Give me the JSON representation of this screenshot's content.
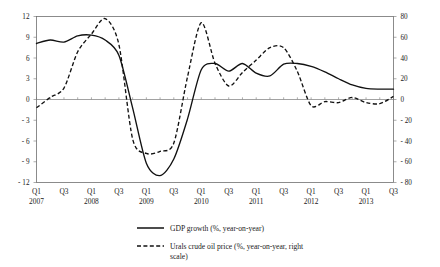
{
  "chart_data": {
    "type": "line",
    "title": "",
    "xlabel": "",
    "ylabel": "",
    "grid": false,
    "legend_position": "bottom",
    "x": [
      "Q1 2007",
      "Q2 2007",
      "Q3 2007",
      "Q4 2007",
      "Q1 2008",
      "Q2 2008",
      "Q3 2008",
      "Q4 2008",
      "Q1 2009",
      "Q2 2009",
      "Q3 2009",
      "Q4 2009",
      "Q1 2010",
      "Q2 2010",
      "Q3 2010",
      "Q4 2010",
      "Q1 2011",
      "Q2 2011",
      "Q3 2011",
      "Q4 2011",
      "Q1 2012",
      "Q2 2012",
      "Q3 2012",
      "Q4 2012",
      "Q1 2013",
      "Q2 2013",
      "Q3 2013"
    ],
    "quarter_ticks": [
      "Q1",
      "Q2",
      "Q3",
      "Q4",
      "Q1",
      "Q2",
      "Q3",
      "Q4",
      "Q1",
      "Q2",
      "Q3",
      "Q4",
      "Q1",
      "Q2",
      "Q3",
      "Q4",
      "Q1",
      "Q2",
      "Q3",
      "Q4",
      "Q1",
      "Q2",
      "Q3",
      "Q4",
      "Q1",
      "Q2",
      "Q3"
    ],
    "quarter_tick_labels": [
      "Q1",
      "",
      "Q3",
      "",
      "Q1",
      "",
      "Q3",
      "",
      "Q1",
      "",
      "Q3",
      "",
      "Q1",
      "",
      "Q3",
      "",
      "Q1",
      "",
      "Q3",
      "",
      "Q1",
      "",
      "Q3",
      "",
      "Q1",
      "",
      "Q3"
    ],
    "year_tick_labels": [
      "2007",
      "",
      "",
      "",
      "2008",
      "",
      "",
      "",
      "2009",
      "",
      "",
      "",
      "2010",
      "",
      "",
      "",
      "2011",
      "",
      "",
      "",
      "2012",
      "",
      "",
      "",
      "2013",
      "",
      ""
    ],
    "series": [
      {
        "name": "GDP growth (%, year-on-year)",
        "axis": "left",
        "style": "solid",
        "values": [
          8.1,
          8.6,
          8.3,
          9.2,
          9.3,
          8.6,
          6.4,
          -1.2,
          -9.2,
          -11.0,
          -8.6,
          -2.8,
          4.3,
          5.2,
          4.1,
          5.2,
          3.8,
          3.4,
          5.1,
          5.2,
          4.8,
          4.0,
          3.0,
          2.1,
          1.6,
          1.5,
          1.5
        ]
      },
      {
        "name": "Urals crude oil price (%, year-on-year, right scale)",
        "axis": "right",
        "style": "dashed",
        "values": [
          -8,
          2,
          11,
          46,
          63,
          78,
          53,
          -38,
          -52,
          -50,
          -42,
          22,
          74,
          35,
          13,
          26,
          38,
          50,
          50,
          27,
          -6,
          -2,
          -3,
          2,
          -3,
          -4,
          3
        ]
      }
    ],
    "left_axis": {
      "min": -12,
      "max": 12,
      "ticks": [
        12,
        9,
        6,
        3,
        0,
        -3,
        -6,
        -9,
        -12
      ],
      "tick_labels": [
        "12",
        "9",
        "6",
        "3",
        "0",
        "- 3",
        "- 6",
        "- 9",
        "- 12"
      ]
    },
    "right_axis": {
      "min": -80,
      "max": 80,
      "ticks": [
        80,
        60,
        40,
        20,
        0,
        -20,
        -40,
        -60,
        -80
      ],
      "tick_labels": [
        "80",
        "60",
        "40",
        "20",
        "0",
        "- 20",
        "- 40",
        "- 60",
        "- 80"
      ]
    },
    "legend": [
      {
        "label": "GDP growth (%, year-on-year)",
        "style": "solid"
      },
      {
        "label": "Urals crude oil price (%, year-on-year, right",
        "label2": "scale)",
        "style": "dashed"
      }
    ]
  }
}
